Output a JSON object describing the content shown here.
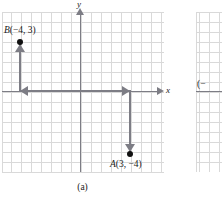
{
  "figure": {
    "caption": "(a)",
    "axes": {
      "x_label": "x",
      "y_label": "y"
    },
    "points": [
      {
        "name": "A",
        "label": "A(3, −4)",
        "label_var": "A",
        "label_coords": "(3, −4)",
        "x": 3,
        "y": -4
      },
      {
        "name": "B",
        "label": "B(−4, 3)",
        "label_var": "B",
        "label_coords": "(−4, 3)",
        "x": -4,
        "y": 3
      }
    ],
    "path": {
      "description": "translation path from A up to the x-axis, left along the x-axis, then up to B",
      "arrows": [
        "left",
        "right",
        "down",
        "up"
      ]
    },
    "colors": {
      "axis": "#7d7d85",
      "grid": "#d9d9d9",
      "point": "#111111",
      "text": "#1a1a1a"
    }
  },
  "neighbor_figure": {
    "partial_label": "(−"
  }
}
